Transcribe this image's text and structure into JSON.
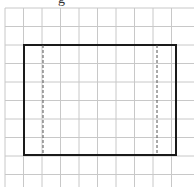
{
  "diagram": {
    "top_label_partial": "g",
    "grid": {
      "origin_x": 5,
      "origin_y": 8,
      "cell_size": 18.5,
      "columns": 10,
      "rows": 10,
      "line_color": "#c8c8c8"
    },
    "rectangle": {
      "x": 24,
      "y": 45,
      "width": 152,
      "height": 110,
      "stroke_color": "#1a1a1a",
      "stroke_width": 2
    },
    "dashed_lines": [
      {
        "x": 43,
        "y1": 45,
        "y2": 155
      },
      {
        "x": 157,
        "y1": 45,
        "y2": 155
      }
    ]
  }
}
